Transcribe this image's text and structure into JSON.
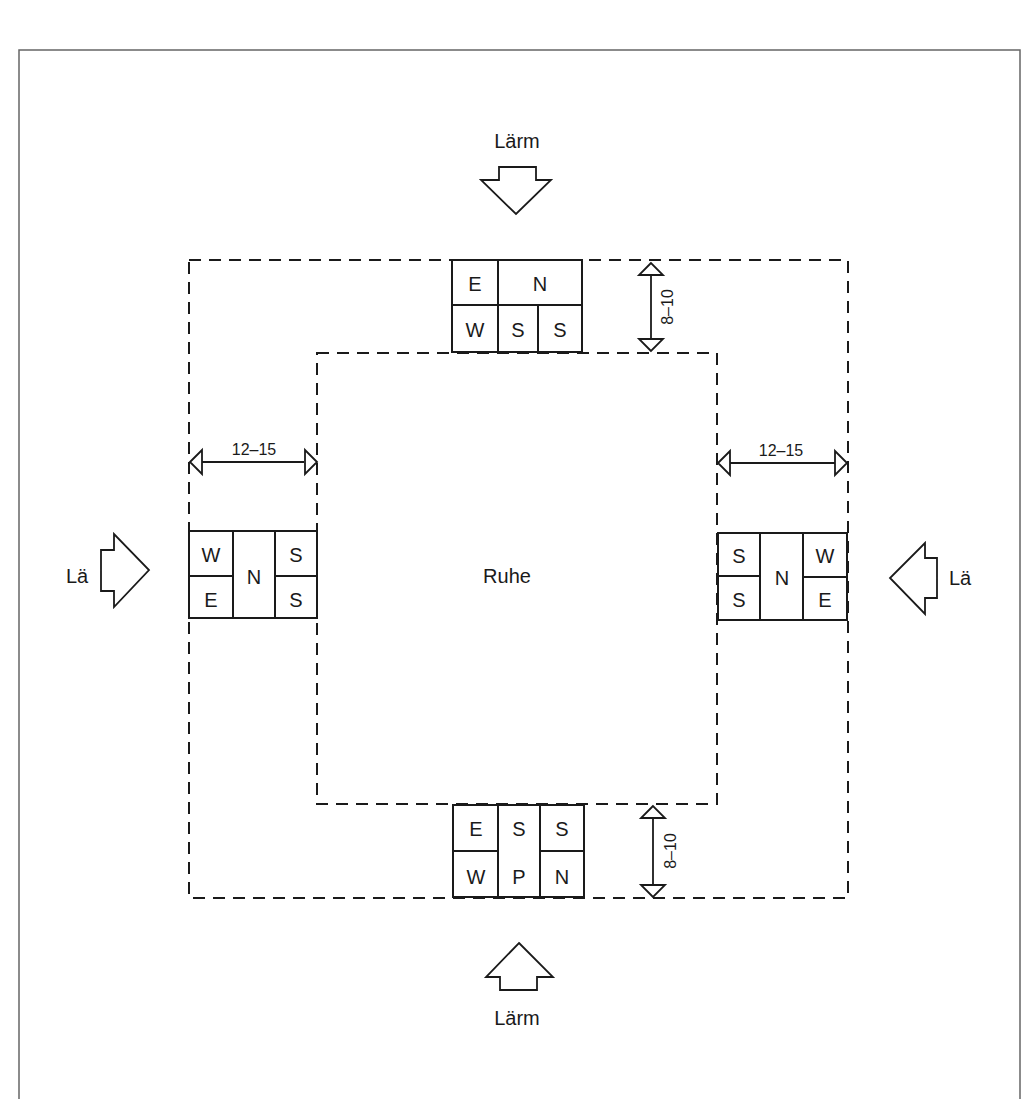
{
  "diagram": {
    "type": "site-plan-noise-zoning",
    "center_label": "Ruhe",
    "noise_labels": {
      "top": "Lärm",
      "bottom": "Lärm",
      "left": "Lä",
      "right": "Lä"
    },
    "dimensions": {
      "top_depth": "8–10",
      "bottom_depth": "8–10",
      "left_width": "12–15",
      "right_width": "12–15"
    },
    "blocks": {
      "top": {
        "row1": [
          "E",
          "N"
        ],
        "row2": [
          "W",
          "S",
          "S"
        ]
      },
      "bottom": {
        "col1": [
          "E",
          "W"
        ],
        "col2": [
          "S",
          "P"
        ],
        "col3": [
          "S",
          "N"
        ]
      },
      "left": {
        "col1": [
          "W",
          "E"
        ],
        "col2": [
          "N"
        ],
        "col3": [
          "S",
          "S"
        ]
      },
      "right": {
        "col1": [
          "S",
          "S"
        ],
        "col2": [
          "N"
        ],
        "col3": [
          "W",
          "E"
        ]
      }
    },
    "colors": {
      "ink": "#1a1a1a",
      "frame": "#666666",
      "background": "#ffffff"
    }
  }
}
